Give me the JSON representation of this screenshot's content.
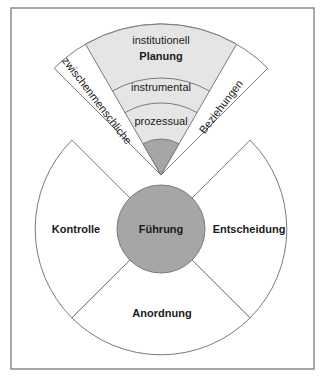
{
  "colors": {
    "frame": "#8a8a8a",
    "stroke": "#7a7a7a",
    "fan_fill": "#e5e5e5",
    "core_fill": "#a6a6a6",
    "white": "#ffffff"
  },
  "top_fan": {
    "title": "Planung",
    "levels": [
      "institutionell",
      "instrumental",
      "prozessual"
    ],
    "left_band": "zwischenmenschliche",
    "right_band": "Beziehungen"
  },
  "bottom_fan": {
    "center": "Führung",
    "left": "Kontrolle",
    "right": "Entscheidung",
    "bottom": "Anordnung"
  }
}
